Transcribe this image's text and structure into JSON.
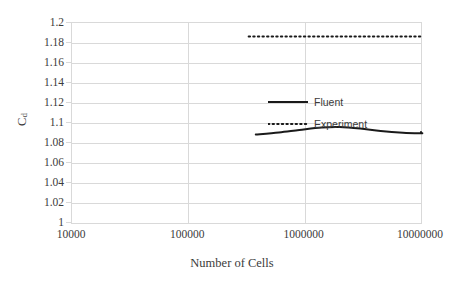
{
  "chart_data": {
    "type": "line",
    "title": "",
    "xlabel": "Number of Cells",
    "ylabel": "C_d",
    "ylabel_base": "C",
    "ylabel_sub": "d",
    "xscale": "log",
    "xlim": [
      10000,
      10000000
    ],
    "ylim": [
      1,
      1.2
    ],
    "ytick_step": 0.02,
    "grid": true,
    "legend_position": "inside-upper-center",
    "yticks": [
      "1.2",
      "1.18",
      "1.16",
      "1.14",
      "1.12",
      "1.1",
      "1.08",
      "1.06",
      "1.04",
      "1.02",
      "1"
    ],
    "ytick_values": [
      1.2,
      1.18,
      1.16,
      1.14,
      1.12,
      1.1,
      1.08,
      1.06,
      1.04,
      1.02,
      1.0
    ],
    "xticks": [
      "10000",
      "100000",
      "1000000",
      "10000000"
    ],
    "xtick_values": [
      10000,
      100000,
      1000000,
      10000000
    ],
    "series": [
      {
        "name": "Fluent",
        "style": "solid",
        "color": "#1a1a1a",
        "width": 2.0,
        "x": [
          380000,
          600000,
          900000,
          1400000,
          2000000,
          3000000,
          4500000,
          7000000,
          11000000,
          18000000,
          30000000,
          60000000
        ],
        "y": [
          1.0885,
          1.0905,
          1.093,
          1.0955,
          1.096,
          1.0945,
          1.092,
          1.0903,
          1.0898,
          1.09,
          1.0905,
          1.091
        ]
      },
      {
        "name": "Experiment",
        "style": "dotted",
        "color": "#1a1a1a",
        "width": 2.0,
        "x": [
          330000,
          100000000
        ],
        "y": [
          1.1865,
          1.1865
        ]
      }
    ],
    "legend": [
      {
        "label": "Fluent",
        "style": "solid",
        "color": "#1a1a1a"
      },
      {
        "label": "Experiment",
        "style": "dotted",
        "color": "#1a1a1a"
      }
    ]
  },
  "axes": {
    "x_title": "Number of Cells",
    "y_title_base": "C",
    "y_title_sub": "d"
  },
  "colors": {
    "grid": "#d9d9d9",
    "frame": "#d9d9d9",
    "series": "#1a1a1a",
    "text": "#3b3b3b",
    "background": "#ffffff"
  }
}
